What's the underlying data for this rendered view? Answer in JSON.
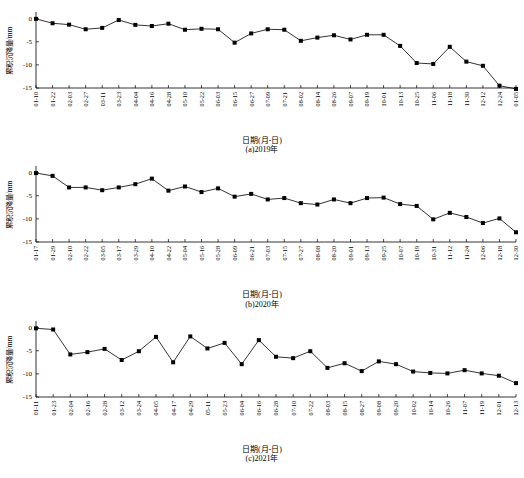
{
  "figure": {
    "background": "#ffffff",
    "line_color": "#000000",
    "marker_color": "#000000",
    "axis_color": "#000000"
  },
  "chart_data": [
    {
      "type": "line",
      "title": "",
      "panel_label": "(a)2019年",
      "xlabel": "日期(月-日)",
      "ylabel": "累积沉降量/mm",
      "ylim": [
        -15,
        1
      ],
      "yticks": [
        0,
        -5,
        -10,
        -15
      ],
      "ytick_labels": [
        "0",
        "-5",
        "-10",
        "-15"
      ],
      "grid": false,
      "legend": null,
      "categories": [
        "01-10",
        "01-22",
        "02-03",
        "02-27",
        "03-11",
        "03-23",
        "04-04",
        "04-16",
        "04-28",
        "05-10",
        "05-22",
        "06-03",
        "06-15",
        "06-27",
        "07-09",
        "07-21",
        "08-02",
        "08-14",
        "08-26",
        "09-07",
        "09-19",
        "10-01",
        "10-13",
        "10-25",
        "11-06",
        "11-18",
        "11-30",
        "12-12",
        "12-24",
        "01-05"
      ],
      "values": [
        -0.05,
        -1.0,
        -1.3,
        -2.3,
        -2.0,
        -0.3,
        -1.35,
        -1.6,
        -1.1,
        -2.4,
        -2.2,
        -2.3,
        -5.2,
        -3.2,
        -2.3,
        -2.4,
        -4.8,
        -4.1,
        -3.6,
        -4.5,
        -3.5,
        -3.5,
        -5.9,
        -9.6,
        -9.8,
        -6.1,
        -9.3,
        -10.2,
        -14.5,
        -15.2
      ]
    },
    {
      "type": "line",
      "title": "",
      "panel_label": "(b)2020年",
      "xlabel": "日期(月-日)",
      "ylabel": "累积沉降量/mm",
      "ylim": [
        -15,
        1
      ],
      "yticks": [
        0,
        -5,
        -10,
        -15
      ],
      "ytick_labels": [
        "0",
        "-5",
        "-10",
        "-15"
      ],
      "grid": false,
      "legend": null,
      "categories": [
        "01-17",
        "01-29",
        "02-10",
        "02-22",
        "03-05",
        "03-17",
        "03-29",
        "04-10",
        "04-22",
        "05-04",
        "05-16",
        "05-28",
        "06-09",
        "06-21",
        "07-03",
        "07-15",
        "07-27",
        "08-08",
        "08-20",
        "09-01",
        "09-13",
        "09-25",
        "10-07",
        "10-19",
        "10-31",
        "11-12",
        "11-24",
        "12-06",
        "12-18",
        "12-30"
      ],
      "values": [
        -0.1,
        -0.7,
        -3.2,
        -3.2,
        -3.8,
        -3.2,
        -2.5,
        -1.3,
        -3.9,
        -3.0,
        -4.2,
        -3.4,
        -5.2,
        -4.6,
        -5.8,
        -5.5,
        -6.6,
        -6.9,
        -5.8,
        -6.6,
        -5.5,
        -5.4,
        -6.8,
        -7.2,
        -10.1,
        -8.7,
        -9.6,
        -10.9,
        -9.9,
        -12.9
      ]
    },
    {
      "type": "line",
      "title": "",
      "panel_label": "(c)2021年",
      "xlabel": "日期(月-日)",
      "ylabel": "累积沉降量/mm",
      "ylim": [
        -15,
        1
      ],
      "yticks": [
        0,
        -5,
        -10,
        -15
      ],
      "ytick_labels": [
        "0",
        "-5",
        "-10",
        "-15"
      ],
      "grid": false,
      "legend": null,
      "categories": [
        "01-11",
        "01-23",
        "02-04",
        "02-16",
        "02-28",
        "03-12",
        "03-24",
        "04-05",
        "04-17",
        "04-29",
        "05-11",
        "05-23",
        "06-04",
        "06-16",
        "06-28",
        "07-10",
        "07-22",
        "08-03",
        "08-15",
        "08-27",
        "09-08",
        "09-20",
        "10-02",
        "10-14",
        "10-26",
        "11-07",
        "11-19",
        "12-01",
        "12-13"
      ],
      "values": [
        -0.15,
        -0.4,
        -5.8,
        -5.3,
        -4.6,
        -7.0,
        -5.1,
        -2.0,
        -7.5,
        -1.9,
        -4.5,
        -3.3,
        -7.9,
        -2.7,
        -6.3,
        -6.6,
        -5.1,
        -8.7,
        -7.7,
        -9.4,
        -7.3,
        -7.9,
        -9.5,
        -9.8,
        -9.9,
        -9.2,
        -9.9,
        -10.4,
        -12.0
      ]
    }
  ]
}
